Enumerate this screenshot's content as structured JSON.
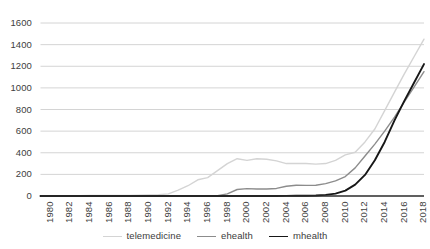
{
  "chart_data": {
    "type": "line",
    "title": "",
    "xlabel": "",
    "ylabel": "",
    "xlim": [
      1980,
      2019
    ],
    "ylim": [
      0,
      1600
    ],
    "grid": true,
    "legend_position": "bottom",
    "y_ticks": [
      0,
      200,
      400,
      600,
      800,
      1000,
      1200,
      1400,
      1600
    ],
    "x_ticks": [
      1980,
      1982,
      1984,
      1986,
      1988,
      1990,
      1992,
      1994,
      1996,
      1998,
      2000,
      2002,
      2004,
      2006,
      2008,
      2010,
      2012,
      2014,
      2016,
      2018
    ],
    "x": [
      1980,
      1981,
      1982,
      1983,
      1984,
      1985,
      1986,
      1987,
      1988,
      1989,
      1990,
      1991,
      1992,
      1993,
      1994,
      1995,
      1996,
      1997,
      1998,
      1999,
      2000,
      2001,
      2002,
      2003,
      2004,
      2005,
      2006,
      2007,
      2008,
      2009,
      2010,
      2011,
      2012,
      2013,
      2014,
      2015,
      2016,
      2017,
      2018,
      2019
    ],
    "series": [
      {
        "name": "telemedicine",
        "color": "#d4d4d4",
        "width": 1.4,
        "values": [
          2,
          2,
          3,
          3,
          3,
          4,
          4,
          5,
          5,
          6,
          7,
          9,
          12,
          20,
          55,
          95,
          150,
          170,
          235,
          300,
          345,
          330,
          345,
          340,
          325,
          300,
          300,
          300,
          295,
          300,
          330,
          380,
          405,
          500,
          620,
          790,
          960,
          1130,
          1290,
          1450
        ]
      },
      {
        "name": "ehealth",
        "color": "#8c8c8c",
        "width": 1.4,
        "values": [
          0,
          0,
          0,
          0,
          0,
          0,
          0,
          0,
          0,
          0,
          0,
          0,
          0,
          0,
          0,
          0,
          0,
          1,
          3,
          20,
          60,
          68,
          65,
          65,
          70,
          90,
          100,
          98,
          100,
          115,
          140,
          180,
          260,
          370,
          480,
          600,
          730,
          870,
          1010,
          1150
        ]
      },
      {
        "name": "mhealth",
        "color": "#171717",
        "width": 1.9,
        "values": [
          0,
          0,
          0,
          0,
          0,
          0,
          0,
          0,
          0,
          0,
          0,
          0,
          0,
          0,
          0,
          0,
          0,
          0,
          0,
          0,
          0,
          0,
          0,
          0,
          0,
          1,
          2,
          3,
          5,
          10,
          22,
          50,
          105,
          195,
          330,
          500,
          700,
          880,
          1050,
          1220
        ]
      }
    ]
  },
  "legend": {
    "items": [
      {
        "label": "telemedicine",
        "color": "#d4d4d4",
        "width": 1.4
      },
      {
        "label": "ehealth",
        "color": "#8c8c8c",
        "width": 1.4
      },
      {
        "label": "mhealth",
        "color": "#171717",
        "width": 1.9
      }
    ]
  },
  "axis": {
    "gridline_color": "#c9c9c9",
    "baseline_color": "#2b2b2b",
    "tick_text_color": "#404040"
  }
}
